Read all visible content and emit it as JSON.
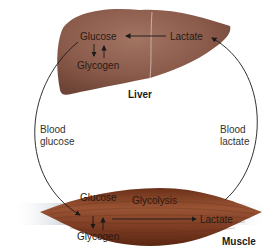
{
  "liver": {
    "label": "Liver",
    "glucose": "Glucose",
    "glycogen": "Glycogen",
    "lactate": "Lactate",
    "color": "#8a5a4a"
  },
  "muscle": {
    "label": "Muscle",
    "glucose": "Glucose",
    "glycogen": "Glycogen",
    "glycolysis": "Glycolysis",
    "lactate": "Lactate",
    "color": "#7a3a22"
  },
  "blood_glucose": [
    "Blood",
    "glucose"
  ],
  "blood_lactate": [
    "Blood",
    "lactate"
  ]
}
